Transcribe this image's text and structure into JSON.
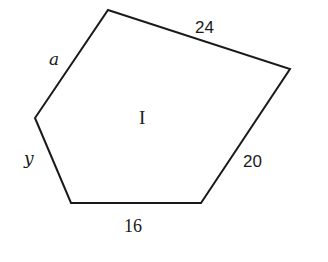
{
  "figure": {
    "type": "pentagon",
    "region_label": "I",
    "stroke_color": "#1a1a1a",
    "background": "#ffffff",
    "vertices": [
      {
        "name": "top",
        "x": 108,
        "y": 10
      },
      {
        "name": "right",
        "x": 290,
        "y": 69
      },
      {
        "name": "bottom-right",
        "x": 201,
        "y": 203
      },
      {
        "name": "bottom-left",
        "x": 71,
        "y": 203
      },
      {
        "name": "left",
        "x": 35,
        "y": 118
      }
    ],
    "sides": [
      {
        "id": "top-right",
        "label": "24"
      },
      {
        "id": "right-lower",
        "label": "20"
      },
      {
        "id": "bottom",
        "label": "16"
      },
      {
        "id": "left-lower",
        "label": "y"
      },
      {
        "id": "left-upper",
        "label": "a"
      }
    ]
  }
}
